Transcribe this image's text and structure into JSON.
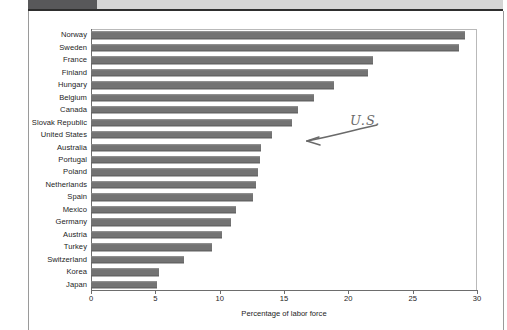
{
  "page": {
    "header_band_color": "#d5d5d5",
    "header_tab_color": "#58585a",
    "rule_color": "#2e2e2e"
  },
  "annotation": {
    "text": "U.S.",
    "icon": "handwritten-arrow-icon",
    "points_to": "United States",
    "color": "#6a6a6a"
  },
  "chart_data": {
    "type": "bar",
    "orientation": "horizontal",
    "title": "",
    "xlabel": "Percentage of labor force",
    "ylabel": "",
    "xlim": [
      0,
      30
    ],
    "xticks": [
      0,
      5,
      10,
      15,
      20,
      25,
      30
    ],
    "grid": false,
    "legend": null,
    "bar_color": "#737373",
    "categories": [
      "Norway",
      "Sweden",
      "France",
      "Finland",
      "Hungary",
      "Belgium",
      "Canada",
      "Slovak Republic",
      "United States",
      "Australia",
      "Portugal",
      "Poland",
      "Netherlands",
      "Spain",
      "Mexico",
      "Germany",
      "Austria",
      "Turkey",
      "Switzerland",
      "Korea",
      "Japan"
    ],
    "values": [
      29.1,
      28.6,
      21.9,
      21.5,
      18.9,
      17.3,
      16.1,
      15.6,
      14.1,
      13.2,
      13.1,
      13.0,
      12.8,
      12.6,
      11.3,
      10.9,
      10.2,
      9.4,
      7.2,
      5.3,
      5.1
    ]
  }
}
